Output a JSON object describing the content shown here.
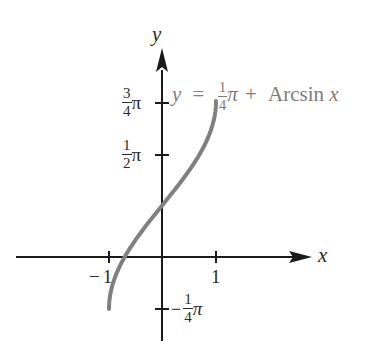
{
  "chart_data": {
    "type": "line",
    "title": "",
    "xlabel": "x",
    "ylabel": "y",
    "xlim": [
      -1.3,
      2.8
    ],
    "ylim": [
      -1.0,
      2.9
    ],
    "grid": false,
    "legend": null,
    "x_ticks": [
      {
        "value": -1,
        "label": "−1"
      },
      {
        "value": 1,
        "label": "1"
      }
    ],
    "y_ticks": [
      {
        "value": -0.7854,
        "label": "−¼π"
      },
      {
        "value": 1.5708,
        "label": "½π"
      },
      {
        "value": 2.3562,
        "label": "¾π"
      }
    ],
    "series": [
      {
        "name": "y = ¼π + Arcsin x",
        "domain": [
          -1,
          1
        ],
        "x": [
          -1.0,
          -0.9,
          -0.75,
          -0.5,
          -0.25,
          0.0,
          0.25,
          0.5,
          0.75,
          0.9,
          1.0
        ],
        "values": [
          -0.785,
          -0.335,
          -0.063,
          0.262,
          0.533,
          0.785,
          1.038,
          1.309,
          1.634,
          1.905,
          2.356
        ],
        "color": "#808080"
      }
    ],
    "annotations": [
      {
        "text": "y = ¼π + Arcsin x",
        "anchor": "upper right of curve"
      }
    ]
  },
  "axes": {
    "x_label": "x",
    "y_label": "y",
    "tick_minus_one": "1",
    "tick_one": "1",
    "minus_sign": "−"
  },
  "y_tick_labels": {
    "three_quarter": {
      "num": "3",
      "den": "4",
      "sym": "π"
    },
    "half": {
      "num": "1",
      "den": "2",
      "sym": "π"
    },
    "neg_quarter": {
      "sign": "−",
      "num": "1",
      "den": "4",
      "sym": "π"
    }
  },
  "equation": {
    "lhs": "y",
    "equals": "=",
    "num": "1",
    "den": "4",
    "pi": "π",
    "plus": "+",
    "func": "Arcsin",
    "arg": "x"
  },
  "colors": {
    "axis": "#1a1a1a",
    "curve": "#808080",
    "label": "#2a2a2a",
    "equation": "#7d7d7d"
  }
}
